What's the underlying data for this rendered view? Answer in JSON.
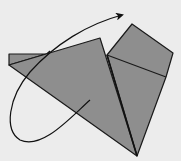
{
  "diagram": {
    "type": "origami-fold-step",
    "colors": {
      "background": "#ececec",
      "paper": "#8e8e8e",
      "outline": "#1a1a1a",
      "arrow": "#111111"
    },
    "shapes": {
      "left_flap": "9,54 45,54 9,65",
      "main_triangle": "9,65 100,38 137,156",
      "right_square": "107,55 132,24 173,53 166,77 137,156",
      "upper_square": "107,55 132,24 173,53 166,77"
    },
    "lines": {
      "crease": {
        "x1": 107,
        "y1": 55,
        "x2": 166,
        "y2": 77
      },
      "fold_edge": {
        "x1": 107,
        "y1": 55,
        "x2": 137,
        "y2": 156
      }
    },
    "arrow": {
      "meaning": "turn-over / rotate-flap arrow",
      "path": "M90,100 C70,118 40,150 18,138 C5,128 10,95 30,72 C55,42 90,22 122,16"
    }
  }
}
